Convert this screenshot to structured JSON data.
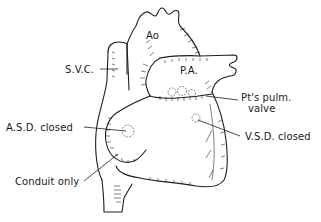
{
  "figure": {
    "type": "anatomical line drawing"
  },
  "labels": {
    "ao": "Ao",
    "svc": "S.V.C.",
    "pa": "P.A.",
    "pulm_valve_line1": "Pt's pulm.",
    "pulm_valve_line2": "valve",
    "asd": "A.S.D. closed",
    "vsd": "V.S.D. closed",
    "conduit": "Conduit only"
  },
  "colors": {
    "ink": "#1e1e1e",
    "background": "#ffffff"
  }
}
